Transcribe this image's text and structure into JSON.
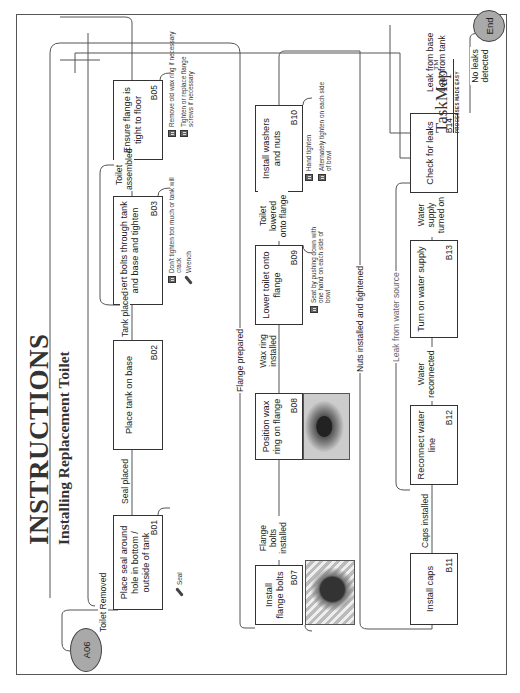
{
  "header": {
    "title": "INSTRUCTIONS",
    "subtitle": "Installing Replacement Toilet"
  },
  "start_node": {
    "id": "A06"
  },
  "end_node": {
    "label": "End"
  },
  "steps": [
    {
      "id": "B01",
      "label": "Place seal around hole in bottom / outside of tank"
    },
    {
      "id": "B02",
      "label": "Place tank on base"
    },
    {
      "id": "B03",
      "label": "Insert bolts through tank and base and tighten"
    },
    {
      "id": "B05",
      "label": "Ensure flange is tight to floor"
    },
    {
      "id": "B07",
      "label": "Install flange bolts"
    },
    {
      "id": "B08",
      "label": "Position wax ring on flange"
    },
    {
      "id": "B09",
      "label": "Lower toilet onto flange"
    },
    {
      "id": "B10",
      "label": "Install washers and nuts"
    },
    {
      "id": "B11",
      "label": "Install caps"
    },
    {
      "id": "B12",
      "label": "Reconnect water line"
    },
    {
      "id": "B13",
      "label": "Turn on water supply"
    },
    {
      "id": "B14",
      "label": "Check for leaks"
    }
  ],
  "edges": {
    "toilet_removed": "Toilet Removed",
    "seal_placed": "Seal placed",
    "tank_placed": "Tank placed",
    "toilet_assembled": "Toilet assembled",
    "flange_prepared": "Flange prepared",
    "flange_bolts_installed": "Flange bolts installed",
    "wax_ring_installed": "Wax ring installed",
    "toilet_lowered": "Toilet lowered onto flange",
    "nuts_installed": "Nuts installed and tightened",
    "caps_installed": "Caps installed",
    "water_reconnected": "Water reconnected",
    "water_supply_on": "Water supply turned on",
    "leak_from_water_source": "Leak from water source",
    "leak_from_base": "Leak from base",
    "leak_from_tank": "Leak from tank",
    "no_leaks": "No leaks detected"
  },
  "annotations": {
    "b01_tool": "Seal",
    "b03_note": "Don't tighten too much or tank will crack",
    "b03_tool": "Wrench",
    "b05_note1": "Remove old wax ring if necessary",
    "b05_note2": "Tighten or replace flange screws if necessary",
    "b07_tool": "Flange bolts",
    "b09_note": "Seat by pushing down with one hand on each side of bowl",
    "b10_note1": "Hand tighten",
    "b10_note2": "Alternately tighten on each side of bowl"
  },
  "logo": {
    "name": "TaskMap",
    "tm": "TM",
    "tagline": "PROCESSES MADE EASY"
  }
}
